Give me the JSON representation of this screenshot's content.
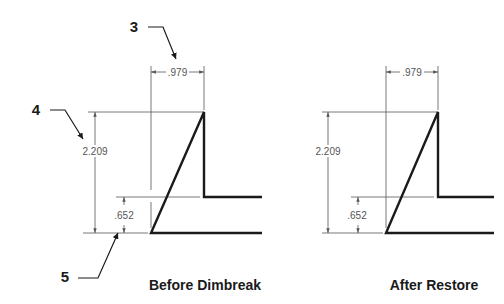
{
  "callouts": [
    {
      "id": "3",
      "label": "3"
    },
    {
      "id": "4",
      "label": "4"
    },
    {
      "id": "5",
      "label": "5"
    }
  ],
  "views": [
    {
      "caption": "Before Dimbreak",
      "dimensions": {
        "horizontal": ".979",
        "overall_height": "2.209",
        "lower_height": ".652"
      }
    },
    {
      "caption": "After Restore",
      "dimensions": {
        "horizontal": ".979",
        "overall_height": "2.209",
        "lower_height": ".652"
      }
    }
  ],
  "colors": {
    "geometry": "#1a1a1a",
    "dimension": "#555555",
    "background": "#ffffff"
  }
}
